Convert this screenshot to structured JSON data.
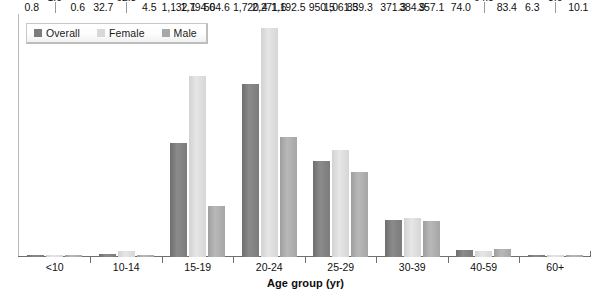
{
  "chart_data": {
    "type": "bar",
    "title": "",
    "subtitle": "",
    "xlabel": "Age group (yr)",
    "ylabel": "",
    "grid": false,
    "legend_position": "top-left",
    "ylim": [
      0,
      2500
    ],
    "categories": [
      "<10",
      "10-14",
      "15-19",
      "20-24",
      "25-29",
      "30-39",
      "40-59",
      "60+"
    ],
    "series": [
      {
        "name": "Overall",
        "color": "#7c7c7c",
        "values": [
          0.8,
          32.7,
          1132.1,
          1720.4,
          950.5,
          371.3,
          74.0,
          6.3
        ],
        "labels": [
          "0.8",
          "32.7",
          "1,132.1",
          "1,720.4",
          "950.5",
          "371.3",
          "74.0",
          "6.3"
        ]
      },
      {
        "name": "Female",
        "color": "#d9d9d9",
        "values": [
          1.0,
          62.3,
          1794.6,
          2271.6,
          1061.5,
          384.9,
          64.5,
          3.0
        ],
        "labels": [
          "1.0",
          "62.3",
          "1,794.6",
          "2,271.6",
          "1,061.5",
          "384.9",
          "64.5",
          "3.0"
        ]
      },
      {
        "name": "Male",
        "color": "#a8a8a8",
        "values": [
          0.6,
          4.5,
          504.6,
          1192.5,
          839.3,
          357.1,
          83.4,
          10.1
        ],
        "labels": [
          "0.6",
          "4.5",
          "504.6",
          "1,192.5",
          "839.3",
          "357.1",
          "83.4",
          "10.1"
        ]
      }
    ]
  },
  "legend": {
    "entries": [
      {
        "label": "Overall",
        "color": "#7c7c7c"
      },
      {
        "label": "Female",
        "color": "#d9d9d9"
      },
      {
        "label": "Male",
        "color": "#a8a8a8"
      }
    ]
  },
  "axis": {
    "x_title": "Age group (yr)"
  }
}
